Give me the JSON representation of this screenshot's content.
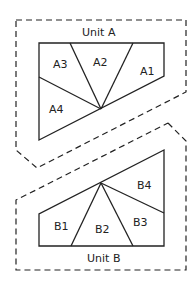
{
  "diagram": {
    "units": [
      {
        "name": "Unit A",
        "sections": [
          {
            "label": "A1"
          },
          {
            "label": "A2"
          },
          {
            "label": "A3"
          },
          {
            "label": "A4"
          }
        ]
      },
      {
        "name": "Unit B",
        "sections": [
          {
            "label": "B1"
          },
          {
            "label": "B2"
          },
          {
            "label": "B3"
          },
          {
            "label": "B4"
          }
        ]
      }
    ],
    "colors": {
      "line": "#222222",
      "background": "#ffffff"
    }
  }
}
